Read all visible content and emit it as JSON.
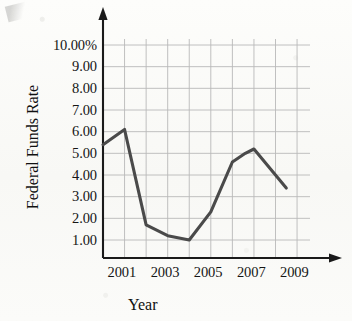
{
  "figure": {
    "axis_color": "#1a1a1a",
    "grid_color": "#b9b9b9",
    "line_color": "#4a4a4a",
    "paper_color": "#fbfbf9",
    "text_color": "#151515"
  },
  "chart_data": {
    "type": "line",
    "title": "",
    "xlabel": "Year",
    "ylabel": "Federal Funds Rate",
    "xlim": [
      2000,
      2009.6
    ],
    "ylim": [
      0,
      10.6
    ],
    "grid": true,
    "legend": null,
    "y_tick_labels": [
      "10.00%",
      "9.00",
      "8.00",
      "7.00",
      "6.00",
      "5.00",
      "4.00",
      "3.00",
      "2.00",
      "1.00"
    ],
    "y_tick_values": [
      10,
      9,
      8,
      7,
      6,
      5,
      4,
      3,
      2,
      1
    ],
    "x_tick_labels": [
      "2001",
      "2003",
      "2005",
      "2007",
      "2009"
    ],
    "x_tick_values": [
      2001,
      2003,
      2005,
      2007,
      2009
    ],
    "x_gridline_values": [
      2001,
      2002,
      2003,
      2004,
      2005,
      2006,
      2007,
      2008,
      2009
    ],
    "series": [
      {
        "name": "Federal Funds Rate",
        "x": [
          2000.0,
          2001.0,
          2002.0,
          2003.0,
          2004.0,
          2005.0,
          2006.0,
          2006.6,
          2007.0,
          2008.5
        ],
        "values": [
          5.4,
          6.1,
          1.7,
          1.2,
          1.0,
          2.3,
          4.6,
          5.0,
          5.2,
          3.4
        ]
      }
    ]
  }
}
